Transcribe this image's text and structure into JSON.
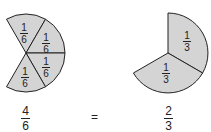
{
  "left_pie": {
    "sector_label_num": "1",
    "sector_label_den": "6",
    "sector_count": 4,
    "caption_num": "4",
    "caption_den": "6"
  },
  "right_pie": {
    "sector_label_num": "1",
    "sector_label_den": "3",
    "sector_count": 2,
    "caption_num": "2",
    "caption_den": "3"
  },
  "equals": "=",
  "colors": {
    "fill": "#d4d4d4",
    "stroke": "#222222"
  }
}
